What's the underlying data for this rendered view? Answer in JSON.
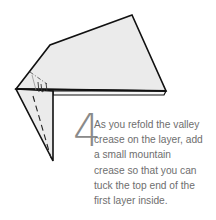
{
  "step": {
    "number": "4",
    "lines": [
      "As you refold the valley",
      "crease on the layer, add",
      "a small mountain",
      "crease so that you can",
      "tuck the top end of the",
      "first layer inside."
    ]
  },
  "colors": {
    "paper_fill": "#ebebeb",
    "outline": "#111111",
    "text": "#6e6e6e",
    "step_number": "#8a8a8a"
  }
}
